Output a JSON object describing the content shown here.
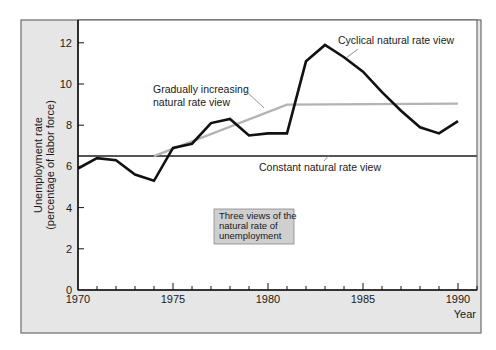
{
  "chart_data": {
    "type": "line",
    "title": "",
    "xlabel": "Year",
    "ylabel": "Unemployment rate (percentage of labor force)",
    "ylabel_lines": [
      "Unemployment rate",
      "(percentage of labor force)"
    ],
    "xlim": [
      1970,
      1991
    ],
    "ylim": [
      0,
      13
    ],
    "x_ticks": [
      1970,
      1975,
      1980,
      1985,
      1990
    ],
    "x_tick_labels": [
      "1970",
      "1975",
      "1980",
      "1985",
      "1990"
    ],
    "y_ticks": [
      0,
      2,
      4,
      6,
      8,
      10,
      12
    ],
    "y_tick_labels": [
      "0",
      "2",
      "4",
      "6",
      "8",
      "10",
      "12"
    ],
    "grid": false,
    "series": [
      {
        "name": "Actual unemployment rate (cyclical natural rate view)",
        "label": "Cyclical natural rate view",
        "color": "#111111",
        "x": [
          1970,
          1971,
          1972,
          1973,
          1974,
          1975,
          1976,
          1977,
          1978,
          1979,
          1980,
          1981,
          1982,
          1983,
          1984,
          1985,
          1986,
          1987,
          1988,
          1989,
          1990
        ],
        "values": [
          5.9,
          6.4,
          6.3,
          5.6,
          5.3,
          6.9,
          7.1,
          8.1,
          8.3,
          7.5,
          7.6,
          7.6,
          11.1,
          11.9,
          11.3,
          10.6,
          9.6,
          8.7,
          7.9,
          7.6,
          8.2
        ]
      },
      {
        "name": "Gradually increasing natural rate view",
        "label": "Gradually increasing natural rate view",
        "label_lines": [
          "Gradually increasing",
          "natural rate view"
        ],
        "color": "#b3b3b3",
        "x": [
          1974,
          1981,
          1990
        ],
        "values": [
          6.5,
          9.0,
          9.05
        ]
      },
      {
        "name": "Constant natural rate view",
        "label": "Constant natural rate view",
        "color": "#555555",
        "x": [
          1970,
          1991
        ],
        "values": [
          6.5,
          6.5
        ]
      }
    ],
    "annotations": [
      {
        "text": "Cyclical natural rate view"
      },
      {
        "text": "Gradually increasing natural rate view"
      },
      {
        "text": "Constant natural rate view"
      }
    ],
    "note_box": {
      "lines": [
        "Three views of the",
        "natural rate of",
        "unemployment"
      ]
    }
  },
  "colors": {
    "frame_bg": "#e6e6e6",
    "plot_bg": "#ffffff",
    "axis": "#111111",
    "note_bg": "#cfcfcf"
  }
}
